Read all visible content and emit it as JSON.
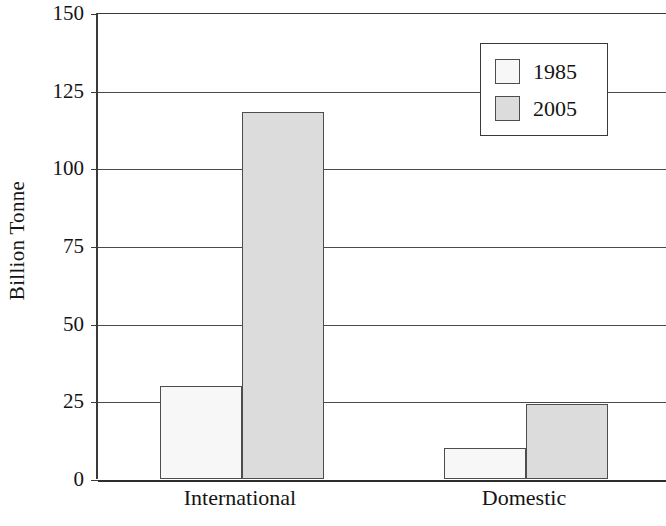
{
  "chart_data": {
    "type": "bar",
    "title": "",
    "subtitle": "",
    "xlabel": "",
    "ylabel": "Billion Tonne",
    "categories": [
      "International",
      "Domestic"
    ],
    "series": [
      {
        "name": "1985",
        "values": [
          30,
          10
        ],
        "color": "#f7f7f7"
      },
      {
        "name": "2005",
        "values": [
          118,
          24
        ],
        "color": "#dcdcdc"
      }
    ],
    "ylim": [
      0,
      150
    ],
    "yticks": [
      0,
      25,
      50,
      75,
      100,
      125,
      150
    ],
    "ytick_labels": [
      "0",
      "25",
      "50",
      "75",
      "100",
      "125",
      "150"
    ],
    "grid": true,
    "grid_axis": "y",
    "legend": {
      "position": "top-right",
      "entries": [
        "1985",
        "2005"
      ]
    },
    "bar_border_color": "#4d4d4d",
    "axis_color": "#3a3a3a"
  },
  "axis": {
    "y_title": "Billion Tonne"
  },
  "legend": {
    "entries": [
      {
        "label": "1985",
        "swatch": "#f7f7f7"
      },
      {
        "label": "2005",
        "swatch": "#dcdcdc"
      }
    ]
  },
  "x_axis": {
    "labels": [
      "International",
      "Domestic"
    ]
  }
}
